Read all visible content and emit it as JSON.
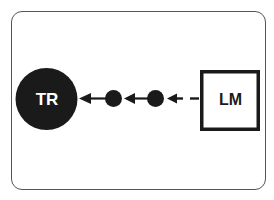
{
  "diagram": {
    "nodes": [
      {
        "id": "TR",
        "label": "TR",
        "shape": "filled-circle",
        "fill": "#1a1a1a",
        "text_color": "#ffffff"
      },
      {
        "id": "n1",
        "label": "",
        "shape": "small-filled-circle",
        "fill": "#1a1a1a"
      },
      {
        "id": "n2",
        "label": "",
        "shape": "small-filled-circle",
        "fill": "#1a1a1a"
      },
      {
        "id": "LM",
        "label": "LM",
        "shape": "outlined-square",
        "stroke": "#1a1a1a",
        "text_color": "#1a1a1a"
      }
    ],
    "edges": [
      {
        "from": "LM",
        "to": "n2",
        "style": "dashed",
        "arrow": "to"
      },
      {
        "from": "n2",
        "to": "n1",
        "style": "solid",
        "arrow": "to"
      },
      {
        "from": "n1",
        "to": "TR",
        "style": "solid",
        "arrow": "to"
      }
    ],
    "frame": {
      "border_color": "#555555",
      "background": "#ffffff"
    }
  }
}
